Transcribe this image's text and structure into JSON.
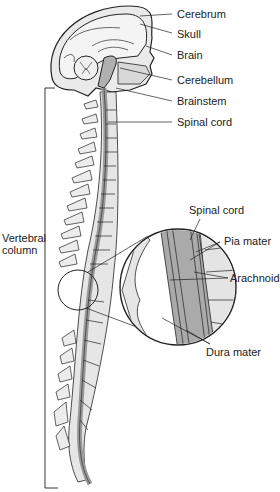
{
  "diagram": {
    "labels": {
      "cerebrum": "Cerebrum",
      "skull": "Skull",
      "brain": "Brain",
      "cerebellum": "Cerebellum",
      "brainstem": "Brainstem",
      "spinal_cord_top": "Spinal cord",
      "vertebral_column_line1": "Vertebral",
      "vertebral_column_line2": "column",
      "spinal_cord_inset": "Spinal cord",
      "pia_mater": "Pia mater",
      "arachnoid": "Arachnoid",
      "dura_mater": "Dura mater"
    },
    "colors": {
      "outline": "#222222",
      "bone_fill": "#e6e6e6",
      "cord_fill": "#a8a8a8",
      "background": "#ffffff"
    }
  }
}
